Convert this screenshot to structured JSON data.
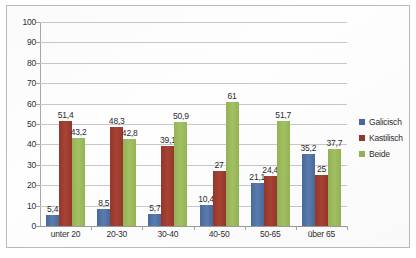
{
  "chart_data": {
    "type": "bar",
    "title": "",
    "xlabel": "",
    "ylabel": "",
    "ylim": [
      0,
      100
    ],
    "ytick_step": 10,
    "yticks": [
      "0",
      "10",
      "20",
      "30",
      "40",
      "50",
      "60",
      "70",
      "80",
      "90",
      "100"
    ],
    "grid": true,
    "legend_position": "right",
    "categories": [
      "unter 20",
      "20-30",
      "30-40",
      "40-50",
      "50-65",
      "über 65"
    ],
    "series": [
      {
        "name": "Galicisch",
        "color": "#48699c",
        "values": [
          5.4,
          8.5,
          5.7,
          10.4,
          21.1,
          35.2
        ],
        "labels": [
          "5,4",
          "8,5",
          "5,7",
          "10,4",
          "21,1",
          "35,2"
        ]
      },
      {
        "name": "Kastilisch",
        "color": "#94372a",
        "values": [
          51.4,
          48.3,
          39.1,
          27,
          24.4,
          25
        ],
        "labels": [
          "51,4",
          "48,3",
          "39,1",
          "27",
          "24,4",
          "25"
        ]
      },
      {
        "name": "Beide",
        "color": "#93b455",
        "values": [
          43.2,
          42.8,
          50.9,
          61,
          51.7,
          37.7
        ],
        "labels": [
          "43,2",
          "42,8",
          "50,9",
          "61",
          "51,7",
          "37,7"
        ]
      }
    ]
  },
  "legend": {
    "items": [
      {
        "label": "Galicisch",
        "color": "#48699c"
      },
      {
        "label": "Kastilisch",
        "color": "#94372a"
      },
      {
        "label": "Beide",
        "color": "#93b455"
      }
    ]
  }
}
